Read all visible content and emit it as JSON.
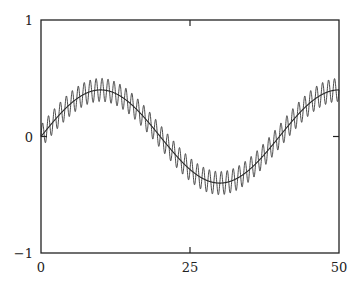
{
  "chart_data": {
    "type": "line",
    "title": "",
    "xlabel": "",
    "ylabel": "",
    "xlim": [
      0,
      50
    ],
    "ylim": [
      -1,
      1
    ],
    "grid": false,
    "legend": null,
    "x_ticks": [
      {
        "value": 0,
        "label": "0"
      },
      {
        "value": 25,
        "label": "25"
      },
      {
        "value": 50,
        "label": "50"
      }
    ],
    "y_ticks": [
      {
        "value": -1,
        "label": "−1"
      },
      {
        "value": 0,
        "label": "0"
      },
      {
        "value": 1,
        "label": "1"
      }
    ],
    "series": [
      {
        "name": "slow sine",
        "formula": "0.4*sin(2*pi*x/40)",
        "amplitude": 0.4,
        "period": 40,
        "color": "#222222",
        "stroke_width": 1.1
      },
      {
        "name": "sine with fast ripple",
        "formula": "0.4*sin(2*pi*x/40) + 0.1*sin(2*pi*x)",
        "amplitude": 0.4,
        "period": 40,
        "ripple_amplitude": 0.1,
        "ripple_period": 1,
        "color": "#333333",
        "stroke_width": 0.9
      }
    ],
    "samples": 2000
  },
  "layout": {
    "plot": {
      "left": 41,
      "right": 339,
      "top": 20,
      "bottom": 253
    },
    "axis_color": "#222222"
  }
}
